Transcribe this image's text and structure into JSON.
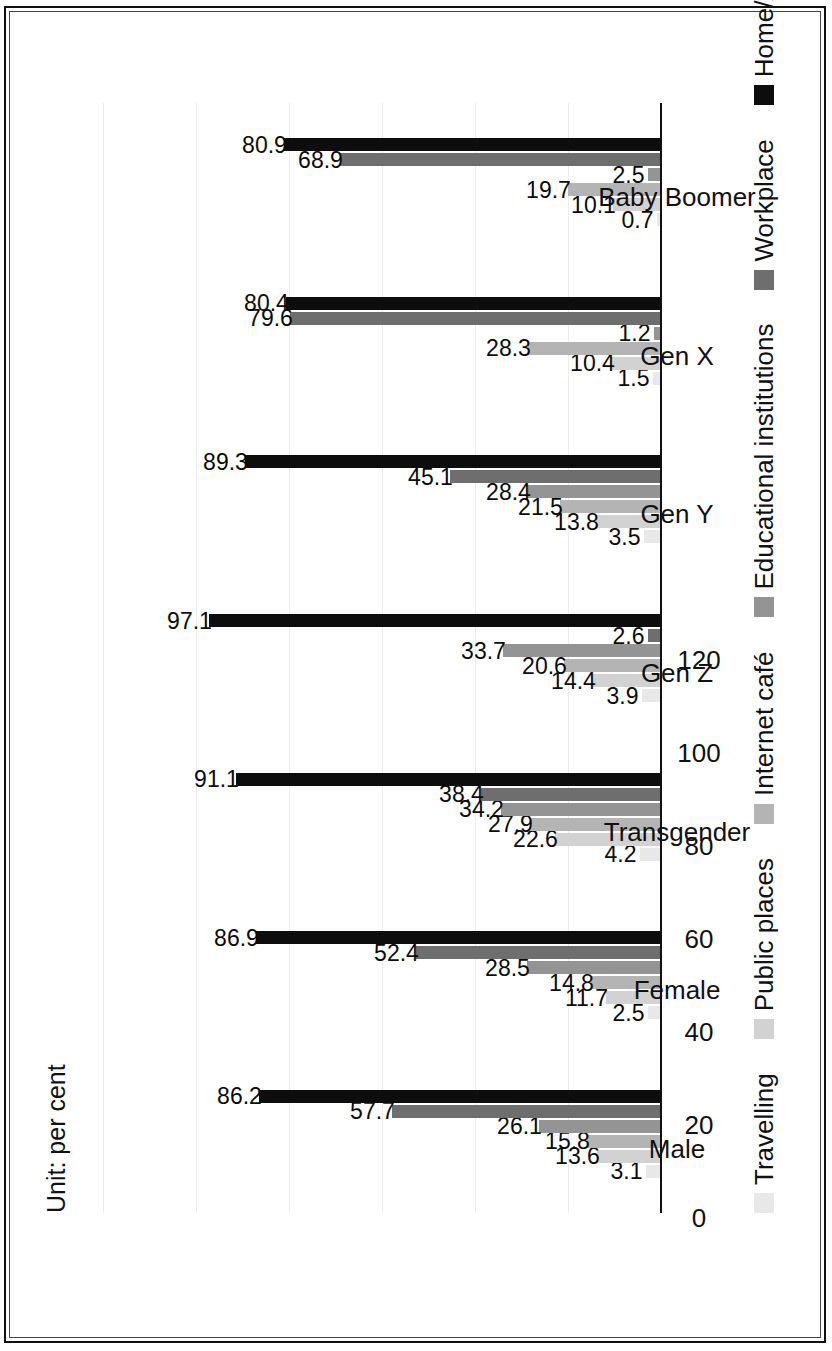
{
  "figure": {
    "unit_note": "Unit: per cent"
  },
  "chart_data": {
    "type": "bar",
    "title": "",
    "subtitle": "",
    "xlabel": "",
    "ylabel": "",
    "unit_note": "Unit: per cent",
    "orientation": "vertical-grouped",
    "grid": true,
    "legend_position": "bottom",
    "ylim": [
      0,
      120
    ],
    "yticks": [
      "0",
      "20",
      "40",
      "60",
      "80",
      "100",
      "120"
    ],
    "ytick_values": [
      0,
      20,
      40,
      60,
      80,
      100,
      120
    ],
    "categories": [
      "Male",
      "Female",
      "Transgender",
      "Gen Z",
      "Gen Y",
      "Gen X",
      "Baby Boomer"
    ],
    "series": [
      {
        "name": "Travelling",
        "color": "#e8e8e8",
        "values": [
          3.1,
          2.5,
          4.2,
          3.9,
          3.5,
          1.5,
          0.7
        ],
        "labels": [
          "3.1",
          "2.5",
          "4.2",
          "3.9",
          "3.5",
          "1.5",
          "0.7"
        ]
      },
      {
        "name": "Public places",
        "color": "#d2d2d2",
        "values": [
          13.6,
          11.7,
          22.6,
          14.4,
          13.8,
          10.4,
          10.1
        ],
        "labels": [
          "13.6",
          "11.7",
          "22.6",
          "14.4",
          "13.8",
          "10.4",
          "10.1"
        ]
      },
      {
        "name": "Internet café",
        "color": "#b4b4b4",
        "values": [
          15.8,
          14.8,
          27.9,
          20.6,
          21.5,
          28.3,
          19.7
        ],
        "labels": [
          "15.8",
          "14.8",
          "27.9",
          "20.6",
          "21.5",
          "28.3",
          "19.7"
        ]
      },
      {
        "name": "Educational institutions",
        "color": "#949494",
        "values": [
          26.1,
          28.5,
          34.2,
          33.7,
          28.4,
          1.2,
          2.5
        ],
        "labels": [
          "26.1",
          "28.5",
          "34.2",
          "33.7",
          "28.4",
          "1.2",
          "2.5"
        ]
      },
      {
        "name": "Workplace",
        "color": "#6e6e6e",
        "values": [
          57.7,
          52.4,
          38.4,
          2.6,
          45.1,
          79.6,
          68.9
        ],
        "labels": [
          "57.7",
          "52.4",
          "38.4",
          "2.6",
          "45.1",
          "79.6",
          "68.9"
        ]
      },
      {
        "name": "Home/Accomodation",
        "color": "#0d0d0d",
        "values": [
          86.2,
          86.9,
          91.1,
          97.1,
          89.3,
          80.4,
          80.9
        ],
        "labels": [
          "86.2",
          "86.9",
          "91.1",
          "97.1",
          "89.3",
          "80.4",
          "80.9"
        ]
      }
    ]
  }
}
